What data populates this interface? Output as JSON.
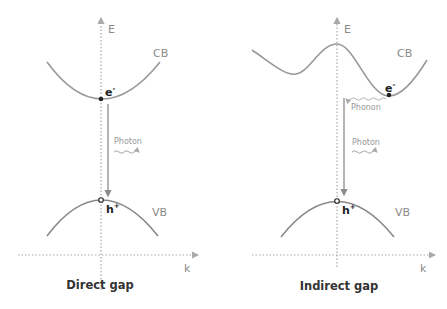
{
  "colors": {
    "curve": "#999999",
    "axis": "#aaaaaa",
    "arrow": "#8c8c8c",
    "electron": "#222222",
    "phonon": "#aaaaaa"
  },
  "panels": [
    {
      "id": "direct",
      "title": "Direct gap",
      "energy_axis_label": "E",
      "momentum_axis_label": "k",
      "conduction_band_label": "CB",
      "valence_band_label": "VB",
      "electron_label": "e",
      "electron_sup": "-",
      "hole_label": "h",
      "hole_sup": "+",
      "photon_label": "Photon"
    },
    {
      "id": "indirect",
      "title": "Indirect gap",
      "energy_axis_label": "E",
      "momentum_axis_label": "k",
      "conduction_band_label": "CB",
      "valence_band_label": "VB",
      "electron_label": "e",
      "electron_sup": "-",
      "hole_label": "h",
      "hole_sup": "+",
      "photon_label": "Photon",
      "phonon_label": "Phonon"
    }
  ]
}
